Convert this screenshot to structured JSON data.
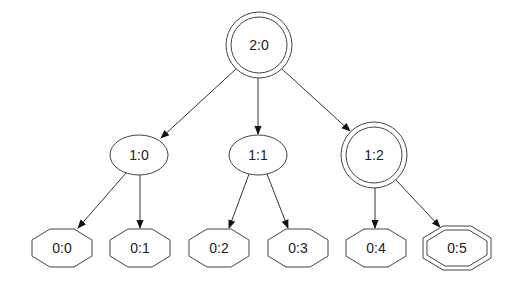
{
  "diagram": {
    "type": "tree",
    "nodes": [
      {
        "id": "2:0",
        "label": "2:0",
        "shape": "doublecircle",
        "cx": 259,
        "cy": 45
      },
      {
        "id": "1:0",
        "label": "1:0",
        "shape": "ellipse",
        "cx": 139,
        "cy": 155
      },
      {
        "id": "1:1",
        "label": "1:1",
        "shape": "ellipse",
        "cx": 258,
        "cy": 155
      },
      {
        "id": "1:2",
        "label": "1:2",
        "shape": "doublecircle",
        "cx": 374,
        "cy": 155
      },
      {
        "id": "0:0",
        "label": "0:0",
        "shape": "octagon",
        "cx": 62,
        "cy": 248
      },
      {
        "id": "0:1",
        "label": "0:1",
        "shape": "octagon",
        "cx": 140,
        "cy": 248
      },
      {
        "id": "0:2",
        "label": "0:2",
        "shape": "octagon",
        "cx": 219,
        "cy": 248
      },
      {
        "id": "0:3",
        "label": "0:3",
        "shape": "octagon",
        "cx": 298,
        "cy": 248
      },
      {
        "id": "0:4",
        "label": "0:4",
        "shape": "octagon",
        "cx": 376,
        "cy": 248
      },
      {
        "id": "0:5",
        "label": "0:5",
        "shape": "doubleoctagon",
        "cx": 457,
        "cy": 248
      }
    ],
    "edges": [
      {
        "from": "2:0",
        "to": "1:0"
      },
      {
        "from": "2:0",
        "to": "1:1"
      },
      {
        "from": "2:0",
        "to": "1:2"
      },
      {
        "from": "1:0",
        "to": "0:0"
      },
      {
        "from": "1:0",
        "to": "0:1"
      },
      {
        "from": "1:1",
        "to": "0:2"
      },
      {
        "from": "1:1",
        "to": "0:3"
      },
      {
        "from": "1:2",
        "to": "0:4"
      },
      {
        "from": "1:2",
        "to": "0:5"
      }
    ]
  },
  "labels": {
    "n20": "2:0",
    "n10": "1:0",
    "n11": "1:1",
    "n12": "1:2",
    "n00": "0:0",
    "n01": "0:1",
    "n02": "0:2",
    "n03": "0:3",
    "n04": "0:4",
    "n05": "0:5"
  }
}
